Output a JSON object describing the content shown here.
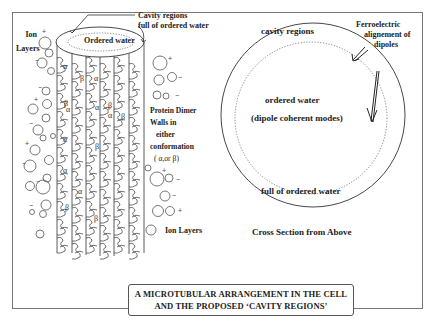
{
  "figure": {
    "caption": {
      "line1": "A MICROTUBULAR ARRANGEMENT IN THE CELL",
      "line2": "AND THE PROPOSED ‘CAVITY REGIONS’"
    },
    "left_panel": {
      "top_ellipse_label": "Ordered water",
      "cavity_callout": {
        "line1": "Cavity regions",
        "line2": "full of ordered water"
      },
      "ion_layers_top": {
        "line1": "Ion",
        "line2": "Layers"
      },
      "ion_layers_bottom": "Ion Layers",
      "protein_dimer": {
        "line1": "Protein Dimer",
        "line2": "Walls  in",
        "line3": "either",
        "line4": "conformation",
        "line5": "( α,or β)"
      },
      "subunit_labels": {
        "alpha": "α",
        "beta": "β"
      },
      "charges": {
        "plus": "+",
        "minus": "−"
      }
    },
    "right_panel": {
      "top_label": "cavity regions",
      "center_line1": "ordered water",
      "center_line2": "(dipole coherent modes)",
      "bottom_label": "full of ordered water",
      "ferro_callout": {
        "line1": "Ferroelectric",
        "line2": "alignement of",
        "line3": "dipoles"
      },
      "subtitle": "Cross Section from Above"
    },
    "colors": {
      "line": "#333333",
      "border": "#777777",
      "background": "#ffffff"
    }
  }
}
